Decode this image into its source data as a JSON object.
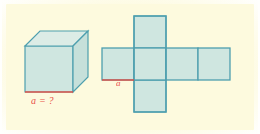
{
  "figure": {
    "background_color": "#fdfade",
    "page_color": "#fffffd"
  },
  "style": {
    "edge_color": "#4e9fae",
    "face_fill": "#cfe6e0",
    "face_fill_light": "#dcebe4",
    "highlight_color": "#e8443a"
  },
  "cube": {
    "name": "cube",
    "label": "a = ?",
    "highlight_edge": "bottom-front-edge",
    "faces": [
      "front",
      "top",
      "right"
    ]
  },
  "net": {
    "name": "cube-net",
    "label": "a",
    "shape": "cross",
    "squares": 6,
    "column_squares": 3,
    "row_squares": 4,
    "highlight_edge": "bottom-edge-of-left-square"
  }
}
